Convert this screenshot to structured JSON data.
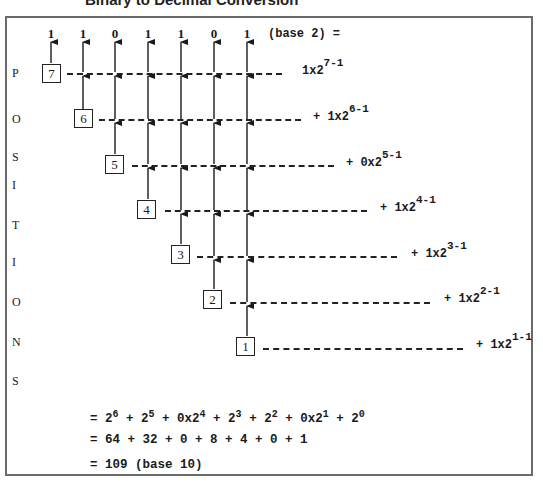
{
  "title": "Binary to Decimal Conversion",
  "binary_digits": [
    "1",
    "1",
    "0",
    "1",
    "1",
    "0",
    "1"
  ],
  "base_label": "(base 2) =",
  "vertical_label": [
    "P",
    "O",
    "S",
    "I",
    "T",
    "I",
    "O",
    "N",
    "S"
  ],
  "positions": [
    "7",
    "6",
    "5",
    "4",
    "3",
    "2",
    "1"
  ],
  "terms": [
    {
      "prefix": "",
      "coef": "1x2",
      "exp": "7-1"
    },
    {
      "prefix": "+ ",
      "coef": "1x2",
      "exp": "6-1"
    },
    {
      "prefix": "+ ",
      "coef": "0x2",
      "exp": "5-1"
    },
    {
      "prefix": "+ ",
      "coef": "1x2",
      "exp": "4-1"
    },
    {
      "prefix": "+ ",
      "coef": "1x2",
      "exp": "3-1"
    },
    {
      "prefix": "+ ",
      "coef": "1x2",
      "exp": "2-1"
    },
    {
      "prefix": "+ ",
      "coef": "1x2",
      "exp": "1-1"
    }
  ],
  "equations": {
    "line1": [
      {
        "t": "= 2",
        "s": "6"
      },
      {
        "t": " + 2",
        "s": "5"
      },
      {
        "t": " + 0x2",
        "s": "4"
      },
      {
        "t": " + 2",
        "s": "3"
      },
      {
        "t": " + 2",
        "s": "2"
      },
      {
        "t": " + 0x2",
        "s": "1"
      },
      {
        "t": " + 2",
        "s": "0"
      }
    ],
    "line2": "= 64 + 32 + 0 + 8 + 4 + 0 + 1",
    "line3": "= 109 (base 10)"
  }
}
